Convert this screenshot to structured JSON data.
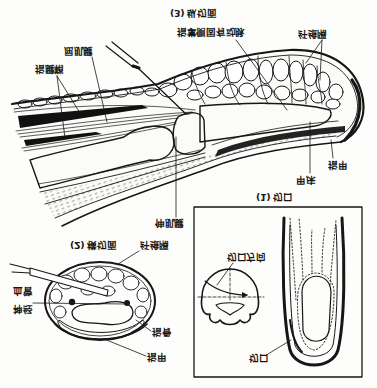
{
  "figure": {
    "longitudinal_section": {
      "caption": "(3) 纵切面",
      "labels": {
        "fibrous_septa": "纤维隔",
        "proper_palmar_digital_artery": "指掌侧固有动脉",
        "flexor_tendon": "屈肌腱",
        "tendon_sheath": "指腱鞘",
        "nail": "指甲",
        "nail_bed": "甲床",
        "extensor_tendon": "伸肌腱"
      }
    },
    "incision_panel": {
      "caption": "(1) 切口",
      "labels": {
        "incision_direction": "切口方向",
        "incision": "切口"
      }
    },
    "cross_section": {
      "caption": "(2) 横切面",
      "labels": {
        "fibrous_septa": "纤维隔",
        "vessel": "血管",
        "nerve": "神经",
        "phalanx": "指骨",
        "nail": "指甲"
      }
    }
  }
}
